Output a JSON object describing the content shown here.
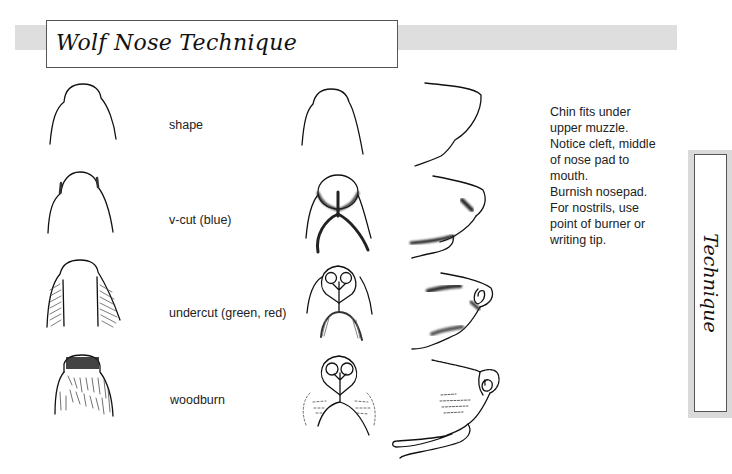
{
  "header": {
    "title": "Wolf Nose Technique"
  },
  "side_tab": {
    "label": "Technique"
  },
  "steps": [
    {
      "label": "shape"
    },
    {
      "label": "v-cut (blue)"
    },
    {
      "label": "undercut (green, red)"
    },
    {
      "label": "woodburn"
    }
  ],
  "notes": {
    "lines": [
      "Chin fits under",
      "upper muzzle.",
      "Notice cleft, middle",
      "of nose pad to",
      "mouth.",
      "Burnish nosepad.",
      "For nostrils, use",
      "point of burner or",
      "writing tip."
    ]
  },
  "colors": {
    "header_band": "#dedede",
    "side_band": "#dadada",
    "border": "#555555",
    "ink": "#111111"
  }
}
